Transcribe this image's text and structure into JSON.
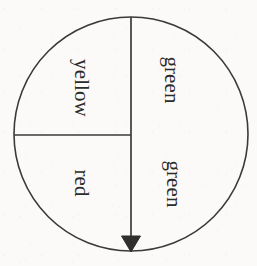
{
  "figure": {
    "kind": "spinner-wheel-diagram",
    "background_color": "#fbfaf8",
    "ink_color": "#3a3a3a",
    "circle": {
      "center_x": 131,
      "center_y": 134,
      "radius": 117,
      "stroke_width": 1.6
    },
    "divider_lines": [
      {
        "name": "vertical-diameter-with-arrow",
        "x1": 131,
        "y1": 17,
        "x2": 131,
        "y2": 251,
        "has_arrowhead": true,
        "arrowhead_at": "bottom",
        "arrowhead_filled": true
      },
      {
        "name": "horizontal-radius-left",
        "x1": 14,
        "y1": 135,
        "x2": 131,
        "y2": 135,
        "has_arrowhead": false
      }
    ],
    "arrowhead": {
      "tip_x": 131,
      "tip_y": 251,
      "half_width": 9,
      "length": 15
    },
    "sectors": [
      {
        "name": "green-upper-right",
        "label": "green",
        "fraction": "1/4",
        "label_x": 171,
        "label_y": 80,
        "rotation_deg": 90
      },
      {
        "name": "green-lower-right",
        "label": "green",
        "fraction": "1/4",
        "label_x": 173,
        "label_y": 184,
        "rotation_deg": 90
      },
      {
        "name": "yellow-upper-left",
        "label": "yellow",
        "fraction": "1/4",
        "label_x": 81,
        "label_y": 88,
        "rotation_deg": 90
      },
      {
        "name": "red-lower-left",
        "label": "red",
        "fraction": "1/4",
        "label_x": 81,
        "label_y": 183,
        "rotation_deg": 90
      }
    ]
  }
}
